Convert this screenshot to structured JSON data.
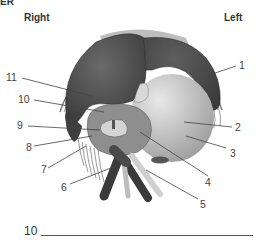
{
  "header": {
    "title_fragment": "ER",
    "orientation_right": "Right",
    "orientation_left": "Left"
  },
  "diagram": {
    "labels": [
      {
        "id": "1",
        "text": "1"
      },
      {
        "id": "2",
        "text": "2"
      },
      {
        "id": "3",
        "text": "3"
      },
      {
        "id": "4",
        "text": "4"
      },
      {
        "id": "5",
        "text": "5"
      },
      {
        "id": "6",
        "text": "6"
      },
      {
        "id": "7",
        "text": "7"
      },
      {
        "id": "8",
        "text": "8"
      },
      {
        "id": "9",
        "text": "9"
      },
      {
        "id": "10",
        "text": "10"
      },
      {
        "id": "11",
        "text": "11"
      }
    ],
    "colors": {
      "dark_lobe": "#4a4a4a",
      "gall_bladder_light": "#c9c9c9",
      "mid_gray": "#8c8c8c",
      "capsule_line": "#666666"
    }
  },
  "answer": {
    "number": "10",
    "blank_value": ""
  }
}
